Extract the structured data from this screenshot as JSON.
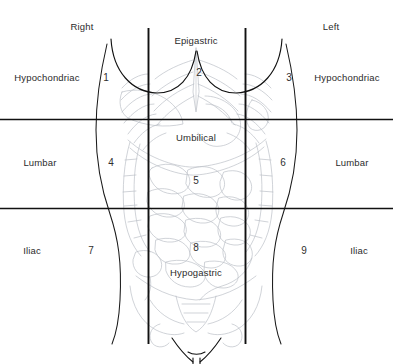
{
  "figure": {
    "line_color": "#111111",
    "outline_color": "#1a1a1a",
    "viscera_color": "#b9bcc4",
    "text_color": "#2b2b2b",
    "background": "#ffffff",
    "width": 393,
    "height": 364
  },
  "headers": [
    {
      "key": "right",
      "label": "Right",
      "x": 82,
      "y": 22
    },
    {
      "key": "left",
      "label": "Left",
      "x": 331,
      "y": 22
    }
  ],
  "region_names": [
    {
      "key": "epigastric",
      "label": "Epigastric",
      "x": 196,
      "y": 36
    },
    {
      "key": "right-hypochondriac",
      "label": "Hypochondriac",
      "x": 47,
      "y": 73
    },
    {
      "key": "left-hypochondriac",
      "label": "Hypochondriac",
      "x": 347,
      "y": 73
    },
    {
      "key": "umbilical",
      "label": "Umbilical",
      "x": 196,
      "y": 133
    },
    {
      "key": "right-lumbar",
      "label": "Lumbar",
      "x": 40,
      "y": 158
    },
    {
      "key": "left-lumbar",
      "label": "Lumbar",
      "x": 352,
      "y": 158
    },
    {
      "key": "hypogastric",
      "label": "Hypogastric",
      "x": 196,
      "y": 268
    },
    {
      "key": "right-iliac",
      "label": "Iliac",
      "x": 32,
      "y": 246
    },
    {
      "key": "left-iliac",
      "label": "Iliac",
      "x": 359,
      "y": 246
    }
  ],
  "region_numbers": [
    {
      "key": "region-1",
      "label": "1",
      "x": 106,
      "y": 73,
      "region": "right-hypochondriac"
    },
    {
      "key": "region-2",
      "label": "2",
      "x": 199,
      "y": 68,
      "region": "epigastric"
    },
    {
      "key": "region-3",
      "label": "3",
      "x": 289,
      "y": 73,
      "region": "left-hypochondriac"
    },
    {
      "key": "region-4",
      "label": "4",
      "x": 111,
      "y": 158,
      "region": "right-lumbar"
    },
    {
      "key": "region-5",
      "label": "5",
      "x": 196,
      "y": 176,
      "region": "umbilical"
    },
    {
      "key": "region-6",
      "label": "6",
      "x": 283,
      "y": 158,
      "region": "left-lumbar"
    },
    {
      "key": "region-7",
      "label": "7",
      "x": 91,
      "y": 246,
      "region": "right-iliac"
    },
    {
      "key": "region-8",
      "label": "8",
      "x": 196,
      "y": 243,
      "region": "hypogastric"
    },
    {
      "key": "region-9",
      "label": "9",
      "x": 304,
      "y": 246,
      "region": "left-iliac"
    }
  ],
  "grid": {
    "vertical_lines": [
      {
        "key": "right-midclavicular-line",
        "x": 148,
        "y1": 28,
        "y2": 344
      },
      {
        "key": "left-midclavicular-line",
        "x": 245,
        "y1": 28,
        "y2": 344
      }
    ],
    "horizontal_lines": [
      {
        "key": "subcostal-plane",
        "y": 119,
        "x1": 0,
        "x2": 393
      },
      {
        "key": "intertubercular-plane",
        "y": 208,
        "x1": 0,
        "x2": 393
      }
    ]
  }
}
